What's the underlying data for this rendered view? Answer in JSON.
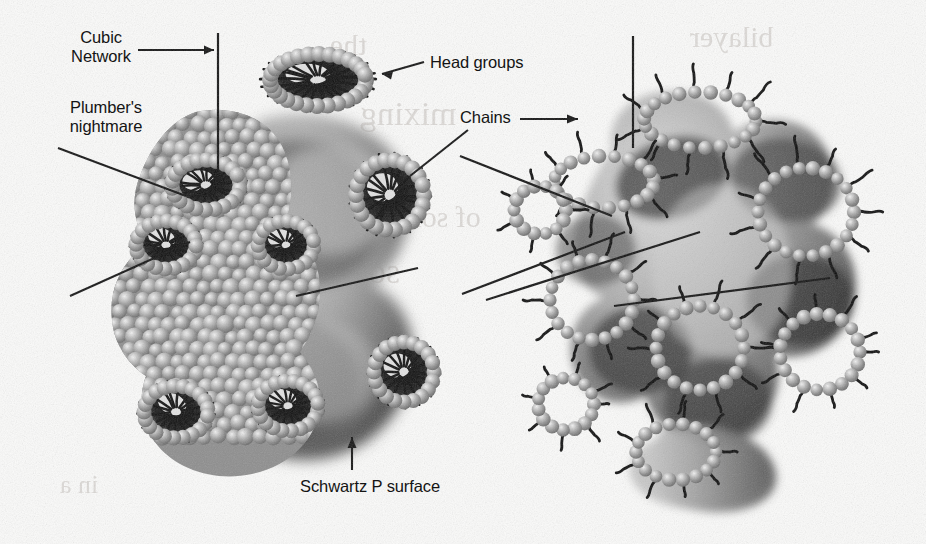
{
  "figure": {
    "title_absent": true,
    "background_color": "#fbfbfa",
    "ink_color": "#141414",
    "bead_color": "#9a9a9a",
    "bead_highlight": "#e6e6e6",
    "surface_dark": "#2a2a2a",
    "surface_mid": "#8e8e8e",
    "surface_light": "#cfcfcf"
  },
  "labels": {
    "cubic_network": "Cubic\nNetwork",
    "plumbers_nightmare": "Plumber's\nnightmare",
    "head_groups": "Head groups",
    "chains": "Chains",
    "schwartz_p_surface": "Schwartz P surface"
  },
  "panels": [
    {
      "id": "left-panel",
      "name": "plumbers-nightmare-bicontinuous-cubic-structure",
      "description": "Bead-packed plumber's nightmare network on a Schwartz P surface",
      "pores": 7
    },
    {
      "id": "right-panel",
      "name": "schwartz-p-surface-with-surfactant-rings",
      "description": "Schwartz P surface with surfactant head-group rings and hydrocarbon chains",
      "pores": 8
    }
  ],
  "annotations": [
    {
      "label_key": "cubic_network",
      "type": "arrow-and-vertical-leader",
      "target": "left-panel-top-pore"
    },
    {
      "label_key": "plumbers_nightmare",
      "type": "two-diagonal-leaders",
      "target": "left-panel-body"
    },
    {
      "label_key": "head_groups",
      "type": "arrow",
      "target": "left-panel-top-pore-beads"
    },
    {
      "label_key": "chains",
      "type": "arrow-and-diagonal-leader",
      "target": "right-panel-chains"
    },
    {
      "label_key": "schwartz_p_surface",
      "type": "vertical-arrow",
      "target": "left-panel-surface"
    }
  ],
  "bleed_through_text": [
    "the",
    "bilayer",
    "of",
    "solid",
    "this",
    "in",
    "mixing",
    "a"
  ]
}
